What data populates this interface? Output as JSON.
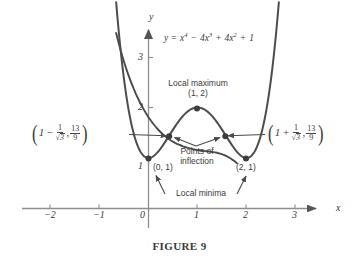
{
  "figure": {
    "caption": "FIGURE 9",
    "equation": {
      "lhs": "y =",
      "term1_base": "x",
      "term1_exp": "4",
      "op1": "−",
      "term2_coef": "4",
      "term2_base": "x",
      "term2_exp": "3",
      "op2": "+",
      "term3_coef": "4",
      "term3_base": "x",
      "term3_exp": "2",
      "op3": "+",
      "term4": "1",
      "full": "y = x⁴ − 4x³ + 4x² + 1"
    }
  },
  "axes": {
    "x_label": "x",
    "y_label": "y",
    "x_ticks": [
      "−2",
      "−1",
      "0",
      "1",
      "2",
      "3"
    ],
    "y_ticks": [
      "1",
      "2",
      "3"
    ],
    "x_range": [
      -2.55,
      3.55
    ],
    "y_range": [
      0,
      3.6
    ],
    "arrow_x": true,
    "arrow_y": true
  },
  "annotations": {
    "local_maximum": {
      "title": "Local maximum",
      "coords": "(1, 2)"
    },
    "points_of_inflection": {
      "line1": "Points of",
      "line2": "inflection"
    },
    "local_minima": {
      "title": "Local minima"
    },
    "min_left_label": "(0, 1)",
    "min_right_label": "(2, 1)",
    "inflection_left": {
      "open_paren": "(",
      "one": "1",
      "minus": "−",
      "frac_num": "1",
      "sqrt": "√",
      "sqrt_radicand": "3",
      "comma": ",",
      "y_num": "13",
      "y_den": "9",
      "close_paren": ")",
      "plain": "(1 − 1/√3, 13/9)"
    },
    "inflection_right": {
      "open_paren": "(",
      "one": "1",
      "plus": "+",
      "frac_num": "1",
      "sqrt": "√",
      "sqrt_radicand": "3",
      "comma": ",",
      "y_num": "13",
      "y_den": "9",
      "close_paren": ")",
      "plain": "(1 + 1/√3, 13/9)"
    }
  },
  "colors": {
    "curve": "#4a4a4a",
    "axis": "#8e8e8e",
    "text": "#3b3b3b",
    "background": "#ffffff",
    "point": "#3d3d3d"
  },
  "chart_data": {
    "type": "line",
    "title": "FIGURE 9",
    "subtitle": "y = x⁴ − 4x³ + 4x² + 1",
    "xlabel": "x",
    "ylabel": "y",
    "xlim": [
      -2.55,
      3.55
    ],
    "ylim": [
      0,
      3.6
    ],
    "grid": false,
    "legend": null,
    "function": "y = x^4 - 4x^3 + 4x^2 + 1",
    "x_ticks": [
      -2,
      -1,
      0,
      1,
      2,
      3
    ],
    "y_ticks": [
      1,
      2,
      3
    ],
    "series": [
      {
        "name": "y = x^4 - 4x^3 + 4x^2 + 1",
        "x": [
          -0.65,
          -0.55,
          -0.45,
          -0.35,
          -0.25,
          -0.15,
          -0.05,
          0.0,
          0.1,
          0.2,
          0.3,
          0.42,
          0.5,
          0.6,
          0.7,
          0.8,
          0.9,
          1.0,
          1.1,
          1.2,
          1.3,
          1.4,
          1.5,
          1.58,
          1.7,
          1.8,
          1.9,
          2.0,
          2.1,
          2.2,
          2.3,
          2.4,
          2.5,
          2.6,
          2.65
        ],
        "y": [
          3.64,
          2.97,
          2.43,
          1.99,
          1.64,
          1.38,
          1.19,
          1.0,
          1.04,
          1.13,
          1.26,
          1.41,
          1.5,
          1.64,
          1.77,
          1.88,
          1.96,
          2.0,
          1.96,
          1.88,
          1.77,
          1.64,
          1.5,
          1.41,
          1.26,
          1.13,
          1.04,
          1.0,
          1.19,
          1.38,
          1.64,
          1.99,
          2.43,
          2.97,
          3.36
        ]
      }
    ],
    "marked_points": [
      {
        "label": "(0, 1)",
        "x": 0,
        "y": 1,
        "kind": "local minimum"
      },
      {
        "label": "(1, 2)",
        "x": 1,
        "y": 2,
        "kind": "local maximum"
      },
      {
        "label": "(2, 1)",
        "x": 2,
        "y": 1,
        "kind": "local minimum"
      },
      {
        "label": "(1 − 1/√3, 13/9)",
        "x": 0.4226,
        "y": 1.4444,
        "kind": "inflection point"
      },
      {
        "label": "(1 + 1/√3, 13/9)",
        "x": 1.5774,
        "y": 1.4444,
        "kind": "inflection point"
      }
    ]
  }
}
